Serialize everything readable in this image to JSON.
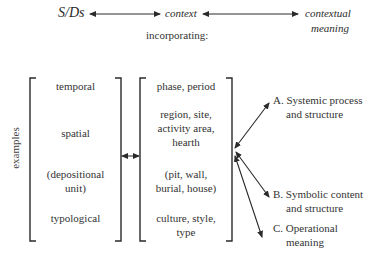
{
  "header": {
    "source_label": "S/Ds",
    "middle_label": "context",
    "target_label_line1": "contextual",
    "target_label_line2": "meaning",
    "subtitle": "incorporating:"
  },
  "side_label": "examples",
  "categories": [
    {
      "label_line1": "temporal",
      "label_line2": "",
      "examples_line1": "phase, period",
      "examples_line2": "",
      "examples_line3": ""
    },
    {
      "label_line1": "spatial",
      "label_line2": "",
      "examples_line1": "region, site,",
      "examples_line2": "activity area,",
      "examples_line3": "hearth"
    },
    {
      "label_line1": "(depositional",
      "label_line2": "unit)",
      "examples_line1": "(pit, wall,",
      "examples_line2": "burial, house)",
      "examples_line3": ""
    },
    {
      "label_line1": "typological",
      "label_line2": "",
      "examples_line1": "culture, style,",
      "examples_line2": "type",
      "examples_line3": ""
    }
  ],
  "outcomes": [
    {
      "line1": "A. Systemic process",
      "line2": "and structure"
    },
    {
      "line1": "B. Symbolic content",
      "line2": "and structure"
    },
    {
      "line1": "C. Operational",
      "line2": "meaning"
    }
  ],
  "colors": {
    "ink": "#2a2a2a",
    "background": "#ffffff"
  }
}
